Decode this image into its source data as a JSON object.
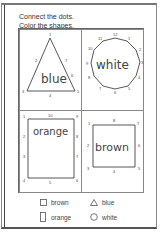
{
  "instructions": {
    "line1": "Connect the dots.",
    "line2": "Color the shapes."
  },
  "shapes": [
    {
      "id": "triangle",
      "word": "blue",
      "dots": [
        "1",
        "2",
        "3",
        "4",
        "5",
        "6",
        "7"
      ]
    },
    {
      "id": "circle",
      "word": "white",
      "dots": [
        "1",
        "2",
        "3",
        "4",
        "5",
        "6",
        "7",
        "8",
        "9",
        "10",
        "11",
        "12"
      ]
    },
    {
      "id": "rectangle",
      "word": "orange",
      "dots": [
        "1",
        "2",
        "3",
        "4",
        "5",
        "6",
        "7",
        "8",
        "9",
        "10"
      ]
    },
    {
      "id": "square",
      "word": "brown",
      "dots": [
        "1",
        "2",
        "3",
        "4",
        "5",
        "6",
        "7",
        "8"
      ]
    }
  ],
  "legend": [
    {
      "shape": "square-icon",
      "label": "brown"
    },
    {
      "shape": "triangle-icon",
      "label": "blue"
    },
    {
      "shape": "rectangle-icon",
      "label": "orange"
    },
    {
      "shape": "circle-icon",
      "label": "white"
    }
  ],
  "colors": {
    "ink": "#444444",
    "border": "#888888",
    "paper": "#ffffff"
  }
}
